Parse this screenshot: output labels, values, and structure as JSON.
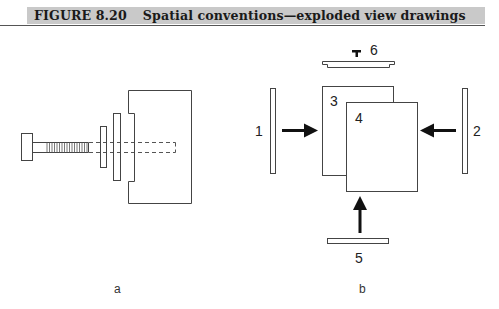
{
  "figure": {
    "number": "FIGURE 8.20",
    "title": "Spatial conventions—exploded view drawings"
  },
  "panels": {
    "a": {
      "caption": "a",
      "parts": [
        "bolt",
        "small-washer",
        "large-washer",
        "stepped-block",
        "hidden-bore"
      ]
    },
    "b": {
      "caption": "b",
      "labels": {
        "part1": "1",
        "part2": "2",
        "part3": "3",
        "part4": "4",
        "part5": "5",
        "part6": "6"
      },
      "arrows": [
        "right",
        "left",
        "up"
      ]
    }
  },
  "colors": {
    "header_bg": "#c9c9c9",
    "line": "#444444",
    "arrow": "#111111"
  }
}
